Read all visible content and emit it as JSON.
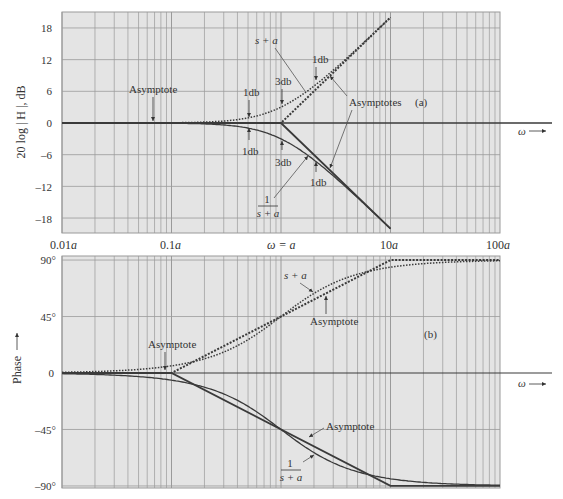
{
  "colors": {
    "background": "#ffffff",
    "plot_bg": "#e4e4e4",
    "grid": "#9a9a9a",
    "curve": "#3a3a3a",
    "text": "#333333"
  },
  "chart_data": [
    {
      "id": "a",
      "type": "line",
      "title": "(a)",
      "xlabel": "ω →",
      "ylabel": "20 log | H |, dB",
      "xscale": "log",
      "x_ticks": [
        "0.01a",
        "0.1a",
        "ω = a",
        "10a",
        "100a"
      ],
      "x_tick_values": [
        0.01,
        0.1,
        1,
        10,
        100
      ],
      "y_ticks": [
        18,
        12,
        6,
        0,
        -6,
        -12,
        -18
      ],
      "ylim": [
        -21,
        21
      ],
      "xlim": [
        0.01,
        100
      ],
      "grid": true,
      "series": [
        {
          "name": "s + a (exact)",
          "style": "dotted",
          "x": [
            0.01,
            0.1,
            0.2,
            0.3,
            0.5,
            0.7,
            1,
            1.5,
            2,
            3,
            5,
            7,
            10
          ],
          "values": [
            0.0,
            0.04,
            0.17,
            0.37,
            0.97,
            1.73,
            3.01,
            5.12,
            6.99,
            10.0,
            14.15,
            16.99,
            20.04
          ]
        },
        {
          "name": "s + a asymptote",
          "style": "dotted-heavy",
          "x": [
            0.01,
            1,
            10
          ],
          "values": [
            0,
            0,
            20
          ]
        },
        {
          "name": "1/(s + a) (exact)",
          "style": "solid",
          "x": [
            0.01,
            0.1,
            0.2,
            0.3,
            0.5,
            0.7,
            1,
            1.5,
            2,
            3,
            5,
            7,
            10
          ],
          "values": [
            0.0,
            -0.04,
            -0.17,
            -0.37,
            -0.97,
            -1.73,
            -3.01,
            -5.12,
            -6.99,
            -10.0,
            -14.15,
            -16.99,
            -20.04
          ]
        },
        {
          "name": "1/(s + a) asymptote",
          "style": "solid-heavy",
          "x": [
            0.01,
            1,
            10
          ],
          "values": [
            0,
            0,
            -20
          ]
        }
      ],
      "annotations": [
        {
          "text": "Asymptote",
          "x": 0.07,
          "y": 0
        },
        {
          "text": "s + a",
          "x": 0.6,
          "y": 12
        },
        {
          "text": "1db",
          "x": 0.5,
          "y": 1
        },
        {
          "text": "3db",
          "x": 1,
          "y": 3
        },
        {
          "text": "1db",
          "x": 2,
          "y": 7
        },
        {
          "text": "Asymptotes",
          "x": 4,
          "y": 5
        },
        {
          "text": "1db",
          "x": 0.5,
          "y": -1
        },
        {
          "text": "3db",
          "x": 1,
          "y": -3
        },
        {
          "text": "1db",
          "x": 2,
          "y": -7
        },
        {
          "text": "1 / (s + a)",
          "x": 0.8,
          "y": -13
        }
      ]
    },
    {
      "id": "b",
      "type": "line",
      "title": "(b)",
      "xlabel": "ω →",
      "ylabel": "Phase",
      "xscale": "log",
      "x_tick_values": [
        0.01,
        0.1,
        1,
        10,
        100
      ],
      "y_ticks": [
        "90°",
        "45°",
        "0",
        "-45°",
        "-90°"
      ],
      "y_tick_values": [
        90,
        45,
        0,
        -45,
        -90
      ],
      "ylim": [
        -91,
        93
      ],
      "xlim": [
        0.01,
        100
      ],
      "grid": true,
      "series": [
        {
          "name": "s + a (exact)",
          "style": "dotted",
          "x": [
            0.01,
            0.1,
            0.2,
            0.3,
            0.5,
            0.7,
            1,
            1.5,
            2,
            3,
            5,
            7,
            10,
            30,
            100
          ],
          "values": [
            0.6,
            5.7,
            11.3,
            16.7,
            26.6,
            35.0,
            45.0,
            56.3,
            63.4,
            71.6,
            78.7,
            81.9,
            84.3,
            88.1,
            89.4
          ]
        },
        {
          "name": "s + a asymptote",
          "style": "dotted-heavy",
          "x": [
            0.01,
            0.1,
            10,
            100
          ],
          "values": [
            0,
            0,
            90,
            90
          ]
        },
        {
          "name": "1/(s + a) (exact)",
          "style": "solid",
          "x": [
            0.01,
            0.1,
            0.2,
            0.3,
            0.5,
            0.7,
            1,
            1.5,
            2,
            3,
            5,
            7,
            10,
            30,
            100
          ],
          "values": [
            -0.6,
            -5.7,
            -11.3,
            -16.7,
            -26.6,
            -35.0,
            -45.0,
            -56.3,
            -63.4,
            -71.6,
            -78.7,
            -81.9,
            -84.3,
            -88.1,
            -89.4
          ]
        },
        {
          "name": "1/(s + a) asymptote",
          "style": "solid-heavy",
          "x": [
            0.01,
            0.1,
            10,
            100
          ],
          "values": [
            0,
            0,
            -90,
            -90
          ]
        }
      ],
      "annotations": [
        {
          "text": "Asymptote",
          "x": 0.13,
          "y": 8
        },
        {
          "text": "s + a",
          "x": 1.5,
          "y": 70
        },
        {
          "text": "Asymptote",
          "x": 3,
          "y": 45
        },
        {
          "text": "Asymptote",
          "x": 3,
          "y": -45
        },
        {
          "text": "1 / (s + a)",
          "x": 2,
          "y": -65
        }
      ]
    }
  ],
  "labels": {
    "top": {
      "ylabel": "20 log | H |, dB",
      "panel": "(a)",
      "omega_arrow": "ω",
      "asymptote_left": "Asymptote",
      "s_plus_a": "s + a",
      "db1_upper_left": "1db",
      "db3_upper": "3db",
      "db1_upper_right": "1db",
      "asymptotes": "Asymptotes",
      "db1_lower_left": "1db",
      "db3_lower": "3db",
      "db1_lower_right": "1db",
      "frac_num": "1",
      "frac_den": "s + a",
      "y_ticks": [
        "18",
        "12",
        "6",
        "0",
        "–6",
        "–12",
        "–18"
      ]
    },
    "xaxis": {
      "t0": "0.01",
      "t1": "0.1",
      "t2": "ω = ",
      "t3": "10",
      "t4": "100",
      "a": "a"
    },
    "bottom": {
      "ylabel": "Phase",
      "panel": "(b)",
      "omega_arrow": "ω",
      "asymptote_left": "Asymptote",
      "s_plus_a": "s + a",
      "asymptote_upper": "Asymptote",
      "asymptote_lower": "Asymptote",
      "frac_num": "1",
      "frac_den": "s + a",
      "y_ticks": [
        "90°",
        "45°",
        "0",
        "–45°",
        "–90°"
      ]
    }
  }
}
